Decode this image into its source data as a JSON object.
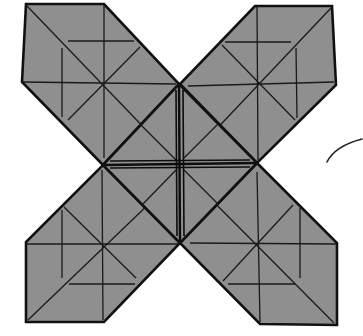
{
  "diagram": {
    "type": "origami-fold-diagram",
    "colors": {
      "paper": "#8f8f8f",
      "line": "#111111",
      "background": "#ffffff"
    },
    "parts": [
      {
        "name": "top-left-arm",
        "center": [
          104,
          84
        ]
      },
      {
        "name": "top-right-arm",
        "center": [
          258,
          84
        ]
      },
      {
        "name": "bottom-left-arm",
        "center": [
          103,
          244
        ]
      },
      {
        "name": "bottom-right-arm",
        "center": [
          258,
          244
        ]
      },
      {
        "name": "center-square",
        "vertices": [
          [
            179,
            84
          ],
          [
            257,
            163
          ],
          [
            180,
            243
          ],
          [
            103,
            165
          ]
        ]
      }
    ],
    "annotations": [
      {
        "name": "curved-arrow",
        "description": "curved motion arrow on right side"
      }
    ]
  }
}
